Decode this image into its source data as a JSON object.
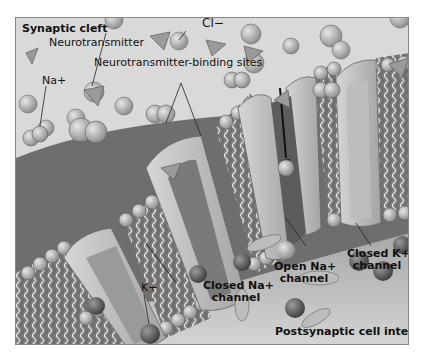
{
  "diagram": {
    "title": "Synaptic cleft",
    "labels": {
      "synaptic_cleft": "Synaptic cleft",
      "chloride": "Cl−",
      "neurotransmitter": "Neurotransmitter",
      "binding_sites": "Neurotransmitter-binding sites",
      "sodium": "Na+",
      "potassium": "K+",
      "open_na_channel_line1": "Open Na+",
      "open_na_channel_line2": "channel",
      "closed_k_channel_line1": "Closed K+",
      "closed_k_channel_line2": "channel",
      "closed_na_channel_line1": "Closed Na+",
      "closed_na_channel_line2": "channel",
      "cell_interior": "Postsynaptic cell interior"
    },
    "colors": {
      "cleft_bg": "#d9d9d9",
      "membrane_surface": "#6e6e6e",
      "interior_bg": "#c8c8c8",
      "channel_light": "#bdbdbd",
      "channel_dark": "#7a7a7a",
      "ion_light": "#a9a9a9",
      "ion_dark": "#555555",
      "arrow": "#111111"
    }
  }
}
